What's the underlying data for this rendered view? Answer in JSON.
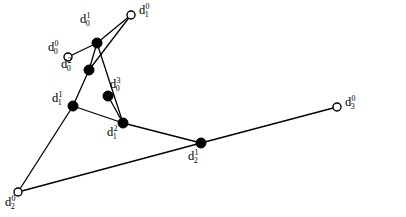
{
  "figure": {
    "type": "graph-diagram",
    "width": 406,
    "height": 217,
    "background_color": "#ffffff",
    "stroke_color": "#000000",
    "caption": "",
    "nodes": [
      {
        "id": "d0_0",
        "base": "d",
        "sub": "0",
        "sup": "0",
        "marker": "open-circle",
        "x": 68,
        "y": 57,
        "label_x": 48,
        "label_y": 41,
        "radius": 4.0
      },
      {
        "id": "d0_1",
        "base": "d",
        "sub": "0",
        "sup": "1",
        "marker": "filled-circle",
        "x": 97,
        "y": 43,
        "label_x": 80,
        "label_y": 13,
        "radius": 5.0
      },
      {
        "id": "d0_2",
        "base": "d",
        "sub": "0",
        "sup": "2",
        "marker": "filled-circle",
        "x": 89,
        "y": 70,
        "label_x": 61,
        "label_y": 58,
        "radius": 5.0
      },
      {
        "id": "d0_3",
        "base": "d",
        "sub": "0",
        "sup": "3",
        "marker": "filled-circle",
        "x": 108,
        "y": 96,
        "label_x": 110,
        "label_y": 78,
        "radius": 5.0
      },
      {
        "id": "d1_0",
        "base": "d",
        "sub": "1",
        "sup": "0",
        "marker": "open-circle",
        "x": 131,
        "y": 15,
        "label_x": 139,
        "label_y": 4,
        "radius": 4.0
      },
      {
        "id": "d1_1",
        "base": "d",
        "sub": "1",
        "sup": "1",
        "marker": "filled-circle",
        "x": 73,
        "y": 106,
        "label_x": 52,
        "label_y": 92,
        "radius": 5.0
      },
      {
        "id": "d1_2",
        "base": "d",
        "sub": "1",
        "sup": "2",
        "marker": "filled-circle",
        "x": 123,
        "y": 123,
        "label_x": 107,
        "label_y": 126,
        "radius": 5.0
      },
      {
        "id": "d2_0",
        "base": "d",
        "sub": "2",
        "sup": "0",
        "marker": "open-circle",
        "x": 18,
        "y": 192,
        "label_x": 5,
        "label_y": 196,
        "radius": 4.0
      },
      {
        "id": "d2_1",
        "base": "d",
        "sub": "2",
        "sup": "1",
        "marker": "filled-circle",
        "x": 201,
        "y": 143,
        "label_x": 188,
        "label_y": 150,
        "radius": 5.0
      },
      {
        "id": "d3_0",
        "base": "d",
        "sub": "3",
        "sup": "0",
        "marker": "open-circle",
        "x": 337,
        "y": 107,
        "label_x": 345,
        "label_y": 96,
        "radius": 4.0
      }
    ],
    "edges": [
      {
        "from": "d0_0",
        "to": "d0_1"
      },
      {
        "from": "d0_1",
        "to": "d1_0"
      },
      {
        "from": "d0_1",
        "to": "d0_2"
      },
      {
        "from": "d0_1",
        "to": "d1_2"
      },
      {
        "from": "d0_2",
        "to": "d1_0"
      },
      {
        "from": "d0_2",
        "to": "d1_1"
      },
      {
        "from": "d1_1",
        "to": "d1_2"
      },
      {
        "from": "d0_3",
        "to": "d1_2"
      },
      {
        "from": "d1_1",
        "to": "d2_0"
      },
      {
        "from": "d2_0",
        "to": "d2_1"
      },
      {
        "from": "d1_2",
        "to": "d2_1"
      },
      {
        "from": "d2_1",
        "to": "d3_0"
      }
    ]
  }
}
